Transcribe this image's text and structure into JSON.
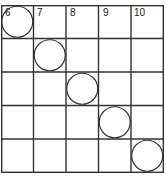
{
  "diagram": {
    "rows": 5,
    "cols": 5,
    "column_labels": [
      "6",
      "7",
      "8",
      "9",
      "10"
    ],
    "circles": [
      {
        "row": 0,
        "col": 0
      },
      {
        "row": 1,
        "col": 1
      },
      {
        "row": 2,
        "col": 2
      },
      {
        "row": 3,
        "col": 3
      },
      {
        "row": 4,
        "col": 4
      }
    ],
    "line_color": "#333333",
    "background": "#ffffff"
  }
}
